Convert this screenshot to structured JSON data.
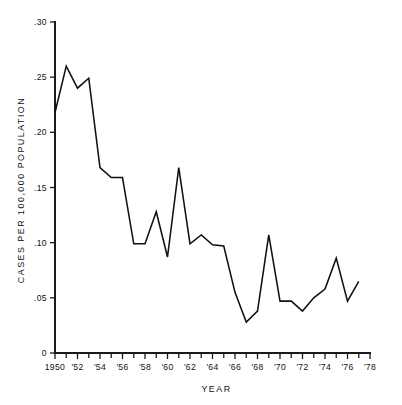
{
  "chart_data": {
    "type": "line",
    "title": "",
    "xlabel": "YEAR",
    "ylabel": "CASES PER 100,000 POPULATION",
    "xlim": [
      1950,
      1978
    ],
    "ylim": [
      0,
      0.3
    ],
    "grid": false,
    "legend": null,
    "x": [
      1950,
      1951,
      1952,
      1953,
      1954,
      1955,
      1956,
      1957,
      1958,
      1959,
      1960,
      1961,
      1962,
      1963,
      1964,
      1965,
      1966,
      1967,
      1968,
      1969,
      1970,
      1971,
      1972,
      1973,
      1974,
      1975,
      1976,
      1977
    ],
    "values": [
      0.218,
      0.26,
      0.24,
      0.249,
      0.168,
      0.159,
      0.159,
      0.099,
      0.099,
      0.128,
      0.087,
      0.168,
      0.099,
      0.107,
      0.098,
      0.097,
      0.055,
      0.028,
      0.038,
      0.107,
      0.047,
      0.047,
      0.038,
      0.05,
      0.058,
      0.086,
      0.047,
      0.065
    ],
    "series": [
      {
        "name": "cases-rate",
        "values": [
          0.218,
          0.26,
          0.24,
          0.249,
          0.168,
          0.159,
          0.159,
          0.099,
          0.099,
          0.128,
          0.087,
          0.168,
          0.099,
          0.107,
          0.098,
          0.097,
          0.055,
          0.028,
          0.038,
          0.107,
          0.047,
          0.047,
          0.038,
          0.05,
          0.058,
          0.086,
          0.047,
          0.065
        ]
      }
    ],
    "y_ticks": [
      0,
      0.05,
      0.1,
      0.15,
      0.2,
      0.25,
      0.3
    ],
    "y_tick_labels": [
      "0",
      ".05",
      ".10",
      ".15",
      ".20",
      ".25",
      ".30"
    ],
    "x_major_ticks": [
      1950,
      1952,
      1954,
      1956,
      1958,
      1960,
      1962,
      1964,
      1966,
      1968,
      1970,
      1972,
      1974,
      1976,
      1978
    ],
    "x_tick_labels": [
      "1950",
      "'52",
      "'54",
      "'56",
      "'58",
      "'60",
      "'62",
      "'64",
      "'66",
      "'68",
      "'70",
      "'72",
      "'74",
      "'76",
      "'78"
    ],
    "x_minor_ticks": [
      1951,
      1953,
      1955,
      1957,
      1959,
      1961,
      1963,
      1965,
      1967,
      1969,
      1971,
      1973,
      1975,
      1977
    ],
    "line_color": "#111111",
    "axis_color": "#1a1a1a",
    "background_color": "#ffffff"
  }
}
